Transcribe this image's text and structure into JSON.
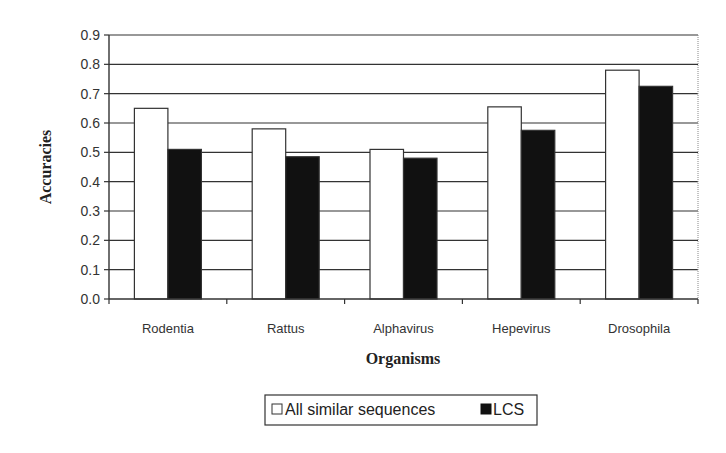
{
  "chart_data": {
    "type": "bar",
    "title": "",
    "xlabel": "Organisms",
    "ylabel": "Accuracies",
    "categories": [
      "Rodentia",
      "Rattus",
      "Alphavirus",
      "Hepevirus",
      "Drosophila"
    ],
    "series": [
      {
        "name": "All similar sequences",
        "color": "#ffffff",
        "values": [
          0.65,
          0.58,
          0.51,
          0.655,
          0.78
        ]
      },
      {
        "name": "LCS",
        "color": "#111111",
        "values": [
          0.51,
          0.485,
          0.48,
          0.575,
          0.725
        ]
      }
    ],
    "ylim": [
      0,
      0.9
    ],
    "yticks": [
      "0.0",
      "0.1",
      "0.2",
      "0.3",
      "0.4",
      "0.5",
      "0.6",
      "0.7",
      "0.8",
      "0.9"
    ],
    "grid": true,
    "legend_position": "bottom"
  },
  "legend": {
    "items": [
      {
        "label": "All similar sequences",
        "swatch": "#ffffff"
      },
      {
        "label": "LCS",
        "swatch": "#111111"
      }
    ]
  }
}
